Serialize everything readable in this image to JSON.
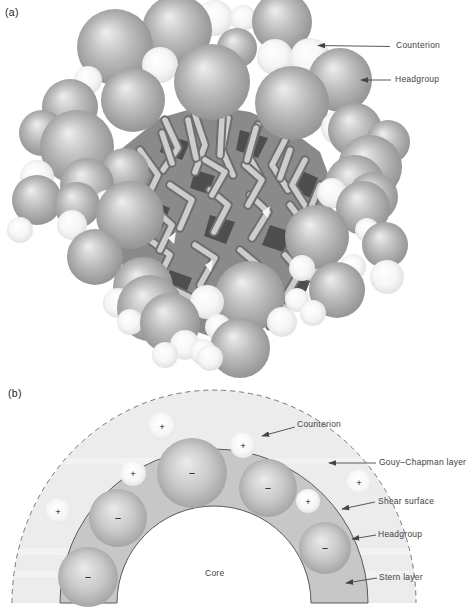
{
  "panel_a": {
    "tag": "(a)",
    "labels": {
      "counterion": "Counterion",
      "headgroup": "Headgroup"
    },
    "arrows": [
      [
        390,
        46.5,
        318,
        45.5
      ],
      [
        391,
        80,
        361,
        80
      ]
    ],
    "blob": [
      [
        120,
        150
      ],
      [
        160,
        118
      ],
      [
        205,
        105
      ],
      [
        250,
        112
      ],
      [
        288,
        128
      ],
      [
        320,
        152
      ],
      [
        334,
        190
      ],
      [
        330,
        232
      ],
      [
        316,
        268
      ],
      [
        292,
        302
      ],
      [
        256,
        328
      ],
      [
        215,
        338
      ],
      [
        174,
        324
      ],
      [
        142,
        297
      ],
      [
        118,
        258
      ],
      [
        110,
        205
      ]
    ],
    "shadows": [
      [
        [
          165,
          135
        ],
        [
          190,
          142
        ],
        [
          182,
          160
        ],
        [
          160,
          152
        ]
      ],
      [
        [
          240,
          130
        ],
        [
          268,
          138
        ],
        [
          258,
          158
        ],
        [
          236,
          150
        ]
      ],
      [
        [
          300,
          170
        ],
        [
          318,
          178
        ],
        [
          310,
          198
        ],
        [
          294,
          190
        ]
      ],
      [
        [
          150,
          200
        ],
        [
          170,
          208
        ],
        [
          162,
          228
        ],
        [
          144,
          220
        ]
      ],
      [
        [
          210,
          215
        ],
        [
          235,
          222
        ],
        [
          226,
          244
        ],
        [
          204,
          236
        ]
      ],
      [
        [
          270,
          225
        ],
        [
          292,
          232
        ],
        [
          283,
          252
        ],
        [
          262,
          245
        ]
      ],
      [
        [
          170,
          270
        ],
        [
          192,
          278
        ],
        [
          184,
          298
        ],
        [
          162,
          290
        ]
      ],
      [
        [
          240,
          290
        ],
        [
          262,
          296
        ],
        [
          252,
          316
        ],
        [
          232,
          308
        ]
      ],
      [
        [
          295,
          270
        ],
        [
          312,
          276
        ],
        [
          305,
          294
        ],
        [
          288,
          288
        ]
      ],
      [
        [
          195,
          170
        ],
        [
          215,
          176
        ],
        [
          208,
          194
        ],
        [
          190,
          188
        ]
      ]
    ],
    "highlights": [
      [
        [
          168,
          238
        ],
        [
          176,
          232
        ],
        [
          174,
          244
        ]
      ],
      [
        [
          262,
          212
        ],
        [
          270,
          206
        ],
        [
          268,
          218
        ]
      ],
      [
        [
          205,
          265
        ],
        [
          213,
          260
        ],
        [
          211,
          272
        ]
      ]
    ],
    "tubes": [
      [
        165,
        120,
        178,
        148,
        163,
        170
      ],
      [
        195,
        115,
        205,
        145,
        195,
        172
      ],
      [
        228,
        118,
        222,
        150,
        233,
        175
      ],
      [
        258,
        125,
        248,
        155,
        262,
        180
      ],
      [
        285,
        140,
        272,
        165,
        288,
        190
      ],
      [
        140,
        150,
        158,
        175,
        146,
        200
      ],
      [
        305,
        160,
        292,
        185,
        308,
        210
      ],
      [
        130,
        195,
        150,
        210,
        138,
        238
      ],
      [
        170,
        185,
        192,
        200,
        180,
        228
      ],
      [
        210,
        190,
        228,
        205,
        214,
        232
      ],
      [
        250,
        195,
        268,
        212,
        252,
        238
      ],
      [
        290,
        205,
        305,
        225,
        290,
        248
      ],
      [
        150,
        240,
        170,
        255,
        158,
        280
      ],
      [
        195,
        245,
        215,
        258,
        200,
        285
      ],
      [
        240,
        250,
        258,
        265,
        244,
        292
      ],
      [
        285,
        255,
        300,
        272,
        286,
        296
      ],
      [
        175,
        290,
        196,
        300,
        185,
        322
      ],
      [
        225,
        295,
        245,
        306,
        230,
        328
      ],
      [
        268,
        295,
        285,
        308,
        270,
        326
      ],
      [
        320,
        185,
        310,
        210,
        322,
        232
      ],
      [
        205,
        160,
        225,
        172,
        212,
        195
      ],
      [
        245,
        165,
        262,
        180,
        248,
        205
      ],
      [
        155,
        210,
        172,
        225,
        160,
        250
      ],
      [
        310,
        240,
        322,
        258,
        310,
        278
      ],
      [
        120,
        168,
        134,
        186,
        124,
        208
      ],
      [
        188,
        120,
        196,
        158
      ],
      [
        222,
        118,
        220,
        155
      ],
      [
        256,
        128,
        247,
        160
      ],
      [
        162,
        133,
        172,
        163
      ],
      [
        290,
        150,
        280,
        178
      ]
    ],
    "gray_spheres": [
      [
        115,
        47,
        38
      ],
      [
        177,
        30,
        35
      ],
      [
        282,
        22,
        30
      ],
      [
        237,
        48,
        20
      ],
      [
        212,
        82,
        38
      ],
      [
        133,
        100,
        32
      ],
      [
        70,
        107,
        28
      ],
      [
        42,
        133,
        23
      ],
      [
        77,
        147,
        37
      ],
      [
        292,
        103,
        37
      ],
      [
        340,
        80,
        32
      ],
      [
        355,
        130,
        27
      ],
      [
        388,
        142,
        22
      ],
      [
        370,
        167,
        32
      ],
      [
        355,
        185,
        30
      ],
      [
        125,
        172,
        24
      ],
      [
        87,
        185,
        27
      ],
      [
        37,
        200,
        25
      ],
      [
        77,
        205,
        23
      ],
      [
        373,
        197,
        25
      ],
      [
        130,
        215,
        34
      ],
      [
        95,
        257,
        28
      ],
      [
        363,
        208,
        27
      ],
      [
        317,
        237,
        32
      ],
      [
        385,
        245,
        23
      ],
      [
        143,
        287,
        30
      ],
      [
        150,
        308,
        33
      ],
      [
        250,
        296,
        35
      ],
      [
        337,
        290,
        28
      ],
      [
        240,
        348,
        30
      ],
      [
        170,
        323,
        30
      ]
    ],
    "white_spheres": [
      [
        215,
        18,
        18
      ],
      [
        243,
        18,
        13
      ],
      [
        160,
        65,
        18
      ],
      [
        88,
        80,
        14
      ],
      [
        275,
        57,
        18
      ],
      [
        310,
        58,
        20
      ],
      [
        37,
        177,
        17
      ],
      [
        338,
        128,
        17
      ],
      [
        332,
        193,
        15
      ],
      [
        72,
        225,
        15
      ],
      [
        20,
        230,
        13
      ],
      [
        107,
        203,
        13
      ],
      [
        118,
        303,
        15
      ],
      [
        130,
        322,
        13
      ],
      [
        207,
        302,
        17
      ],
      [
        218,
        327,
        13
      ],
      [
        185,
        345,
        15
      ],
      [
        203,
        352,
        13
      ],
      [
        282,
        322,
        15
      ],
      [
        297,
        300,
        12
      ],
      [
        313,
        313,
        13
      ],
      [
        353,
        267,
        13
      ],
      [
        367,
        230,
        12
      ],
      [
        387,
        277,
        17
      ],
      [
        165,
        355,
        13
      ],
      [
        210,
        358,
        13
      ],
      [
        302,
        268,
        13
      ]
    ]
  },
  "panel_b": {
    "tag": "(b)",
    "labels": {
      "counterion": "Counterion",
      "gouy_chapman": "Gouy–Chapman layer",
      "shear_surface": "Shear surface",
      "headgroup": "Headgroup",
      "stern_layer": "Stern layer",
      "core": "Core"
    },
    "headgroup_sign": "−",
    "counterion_sign": "+",
    "geometry": {
      "cx": 214,
      "cy": 603,
      "dashed_rx": 202,
      "dashed_ry": 213,
      "stern_outer_r": 154,
      "stern_inner_r": 97
    },
    "headgroups": [
      [
        192,
        473,
        35
      ],
      [
        268,
        488,
        29
      ],
      [
        118,
        518,
        29
      ],
      [
        325,
        548,
        26
      ],
      [
        88,
        577,
        30
      ]
    ],
    "counterions": [
      [
        162,
        426,
        14
      ],
      [
        243,
        445,
        13
      ],
      [
        133,
        473,
        13
      ],
      [
        359,
        482,
        13
      ],
      [
        308,
        501,
        12
      ],
      [
        58,
        511,
        13
      ]
    ],
    "arrows": [
      [
        295,
        427,
        262,
        436
      ],
      [
        376,
        463,
        329,
        463
      ],
      [
        375,
        502,
        342,
        509
      ],
      [
        376,
        535,
        352,
        539
      ],
      [
        377,
        578,
        346,
        583
      ]
    ]
  },
  "colors": {
    "sphere_gray_hi": "#efefef",
    "sphere_gray_mid": "#bcbcbc",
    "sphere_gray_dark": "#868686",
    "sphere_white_dark": "#d8d8d8",
    "tube_light": "#cdcdcd",
    "tube_dark": "#6e6e6e",
    "blob": "#8a8a8a",
    "shadow": "#4e4e4e",
    "highlight": "#f6f6f6",
    "gouy_fill": "#ececec",
    "stripe": "#f6f6f6",
    "stern_fill": "#c7c7c7",
    "outline": "#5a5a5a",
    "dashed": "#787878",
    "arrow": "#454545",
    "sign": "#111111"
  }
}
